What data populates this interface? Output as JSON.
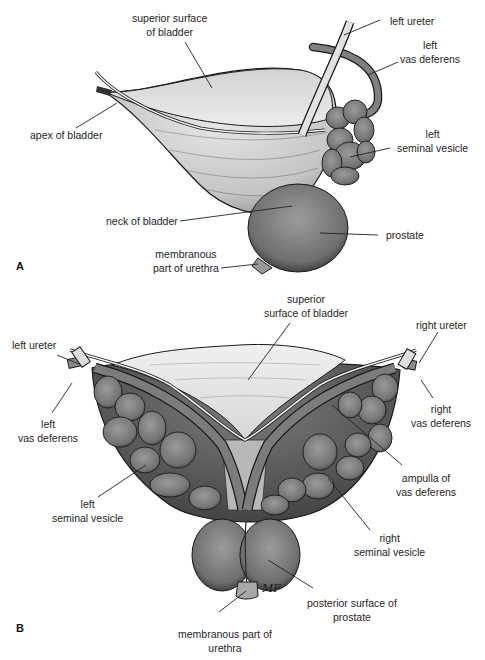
{
  "figure": {
    "panel_a": {
      "letter": "A",
      "labels": {
        "superior_surface": [
          "superior surface",
          "of bladder"
        ],
        "left_ureter": "left ureter",
        "left_vas_deferens": [
          "left",
          "vas deferens"
        ],
        "apex": "apex of bladder",
        "left_seminal_vesicle": [
          "left",
          "seminal vesicle"
        ],
        "neck": "neck of bladder",
        "prostate": "prostate",
        "membranous_urethra": [
          "membranous",
          "part of urethra"
        ]
      }
    },
    "panel_b": {
      "letter": "B",
      "labels": {
        "superior_surface": [
          "superior",
          "surface of bladder"
        ],
        "left_ureter": "left ureter",
        "right_ureter": "right ureter",
        "left_vas_deferens": [
          "left",
          "vas deferens"
        ],
        "right_vas_deferens": [
          "right",
          "vas deferens"
        ],
        "ampulla": [
          "ampulla of",
          "vas deferens"
        ],
        "left_seminal_vesicle": [
          "left",
          "seminal vesicle"
        ],
        "right_seminal_vesicle": [
          "right",
          "seminal vesicle"
        ],
        "posterior_prostate": [
          "posterior surface of",
          "prostate"
        ],
        "membranous_urethra": [
          "membranous part of",
          "urethra"
        ]
      },
      "signature": "MF"
    },
    "colors": {
      "bladder_light": "#e4e4e4",
      "bladder_mid": "#bdbdbd",
      "gland_dark": "#6e6e6e",
      "gland_mid": "#8a8a8a",
      "outline": "#1a1a1a",
      "leader_line": "#222222"
    }
  }
}
